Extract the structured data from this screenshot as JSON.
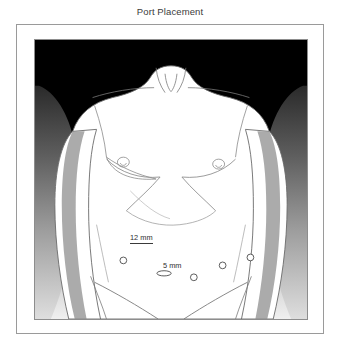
{
  "figure": {
    "title": "Port Placement",
    "type": "medical-illustration",
    "view": "frontal"
  },
  "colors": {
    "background": "#ffffff",
    "frame_border": "#9a9a9a",
    "panel_border": "#8d8d8d",
    "backdrop_top": "#000000",
    "backdrop_bottom": "#e8e8e8",
    "skin_fill": "#ffffff",
    "outline": "#5a5a5a",
    "shadow_gray": "#8e8e8e",
    "label_text": "#2e2e2e",
    "title_text": "#3b3b3b",
    "port_stroke": "#4a4a4a"
  },
  "labels": {
    "port_12mm": "12 mm",
    "port_5mm": "5 mm"
  },
  "ports": [
    {
      "id": "port-left-flank",
      "size": "5 mm",
      "shape": "circle",
      "cx": 106,
      "cy": 236,
      "r": 3.4,
      "labeled": false
    },
    {
      "id": "port-umbilical",
      "size": "12 mm",
      "shape": "ellipse",
      "cx": 147,
      "cy": 249,
      "rx": 7.2,
      "ry": 2.6,
      "labeled": true
    },
    {
      "id": "port-midline",
      "size": "5 mm",
      "shape": "circle",
      "cx": 177,
      "cy": 253,
      "r": 3.4,
      "labeled": true
    },
    {
      "id": "port-right-para",
      "size": "5 mm",
      "shape": "circle",
      "cx": 206,
      "cy": 241,
      "r": 3.4,
      "labeled": false
    },
    {
      "id": "port-right-flank",
      "size": "5 mm",
      "shape": "circle",
      "cx": 234,
      "cy": 233,
      "r": 3.4,
      "labeled": false
    }
  ],
  "anatomy_marks": [
    {
      "name": "sternal-notch",
      "cx": 170,
      "cy": 64
    },
    {
      "name": "nipple-left",
      "cx": 122,
      "cy": 148
    },
    {
      "name": "nipple-right",
      "cx": 225,
      "cy": 150
    },
    {
      "name": "clavicle-left",
      "cx": 135,
      "cy": 82
    },
    {
      "name": "clavicle-right",
      "cx": 206,
      "cy": 82
    }
  ]
}
